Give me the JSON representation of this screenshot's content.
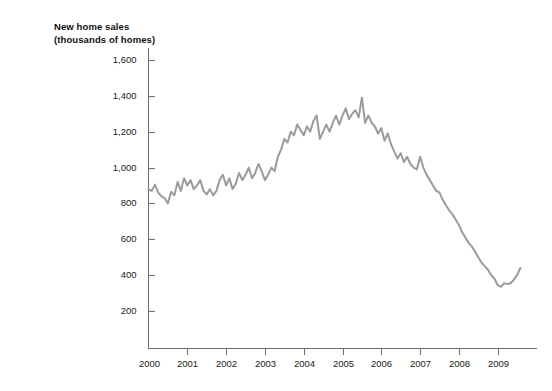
{
  "page": {
    "background_color": "#ffffff",
    "width": 552,
    "height": 391
  },
  "title": {
    "line1": "New home sales",
    "line2": "(thousands of homes)"
  },
  "chart_data": {
    "type": "line",
    "title": "New home sales (thousands of homes)",
    "subtitle": "",
    "xlabel": "",
    "ylabel": "thousands of homes",
    "grid": false,
    "legend": "none",
    "line_color": "#9b9b9b",
    "axis_color": "#6d6d6d",
    "xlim": [
      2000,
      2009.75
    ],
    "ylim": [
      0,
      1700
    ],
    "yticks": [
      200,
      400,
      600,
      800,
      1000,
      1200,
      1400,
      1600
    ],
    "ytick_labels": [
      "200",
      "400",
      "600",
      "800",
      "1,000",
      "1,200",
      "1,400",
      "1,600"
    ],
    "xticks": [
      2000,
      2001,
      2002,
      2003,
      2004,
      2005,
      2006,
      2007,
      2008,
      2009
    ],
    "xtick_labels": [
      "2000",
      "2001",
      "2002",
      "2003",
      "2004",
      "2005",
      "2006",
      "2007",
      "2008",
      "2009"
    ],
    "series": [
      {
        "name": "New home sales",
        "x": [
          2000.0,
          2000.083,
          2000.167,
          2000.25,
          2000.333,
          2000.417,
          2000.5,
          2000.583,
          2000.667,
          2000.75,
          2000.833,
          2000.917,
          2001.0,
          2001.083,
          2001.167,
          2001.25,
          2001.333,
          2001.417,
          2001.5,
          2001.583,
          2001.667,
          2001.75,
          2001.833,
          2001.917,
          2002.0,
          2002.083,
          2002.167,
          2002.25,
          2002.333,
          2002.417,
          2002.5,
          2002.583,
          2002.667,
          2002.75,
          2002.833,
          2002.917,
          2003.0,
          2003.083,
          2003.167,
          2003.25,
          2003.333,
          2003.417,
          2003.5,
          2003.583,
          2003.667,
          2003.75,
          2003.833,
          2003.917,
          2004.0,
          2004.083,
          2004.167,
          2004.25,
          2004.333,
          2004.417,
          2004.5,
          2004.583,
          2004.667,
          2004.75,
          2004.833,
          2004.917,
          2005.0,
          2005.083,
          2005.167,
          2005.25,
          2005.333,
          2005.417,
          2005.5,
          2005.583,
          2005.667,
          2005.75,
          2005.833,
          2005.917,
          2006.0,
          2006.083,
          2006.167,
          2006.25,
          2006.333,
          2006.417,
          2006.5,
          2006.583,
          2006.667,
          2006.75,
          2006.833,
          2006.917,
          2007.0,
          2007.083,
          2007.167,
          2007.25,
          2007.333,
          2007.417,
          2007.5,
          2007.583,
          2007.667,
          2007.75,
          2007.833,
          2007.917,
          2008.0,
          2008.083,
          2008.167,
          2008.25,
          2008.333,
          2008.417,
          2008.5,
          2008.583,
          2008.667,
          2008.75,
          2008.833,
          2008.917,
          2009.0,
          2009.083,
          2009.167,
          2009.25,
          2009.333,
          2009.417,
          2009.5,
          2009.583
        ],
        "values": [
          880,
          870,
          905,
          860,
          840,
          830,
          800,
          865,
          845,
          920,
          870,
          940,
          900,
          930,
          880,
          900,
          930,
          870,
          850,
          880,
          845,
          870,
          930,
          960,
          900,
          940,
          880,
          910,
          970,
          930,
          960,
          1000,
          940,
          970,
          1020,
          980,
          930,
          960,
          1000,
          980,
          1060,
          1100,
          1160,
          1140,
          1200,
          1180,
          1240,
          1210,
          1180,
          1230,
          1200,
          1260,
          1290,
          1160,
          1200,
          1240,
          1200,
          1250,
          1290,
          1240,
          1290,
          1330,
          1270,
          1300,
          1320,
          1280,
          1390,
          1250,
          1290,
          1250,
          1230,
          1190,
          1220,
          1150,
          1190,
          1130,
          1090,
          1050,
          1080,
          1030,
          1060,
          1020,
          1000,
          990,
          1060,
          1000,
          960,
          930,
          900,
          870,
          860,
          820,
          790,
          760,
          740,
          710,
          680,
          640,
          610,
          580,
          560,
          530,
          500,
          470,
          450,
          430,
          400,
          380,
          345,
          335,
          355,
          350,
          355,
          375,
          400,
          440
        ]
      }
    ],
    "annotations": []
  }
}
